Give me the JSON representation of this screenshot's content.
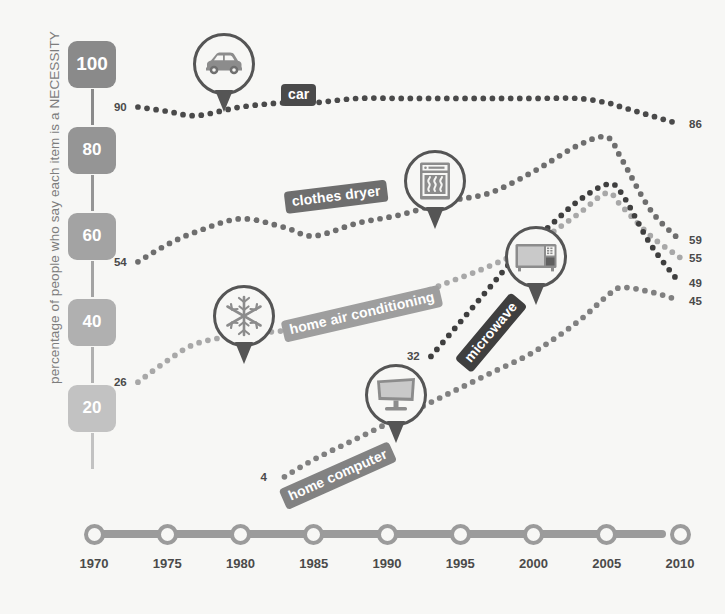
{
  "chart": {
    "type": "line",
    "ylabel": "percentage of people who say each item is a NECESSITY",
    "xlabel": "",
    "title": "",
    "ylim": [
      0,
      105
    ],
    "xlim": [
      1970,
      2010
    ],
    "y_ticks": [
      {
        "label": "100",
        "value": 100,
        "color": "#8a8a8a"
      },
      {
        "label": "80",
        "value": 80,
        "color": "#959595"
      },
      {
        "label": "60",
        "value": 60,
        "color": "#a3a3a3"
      },
      {
        "label": "40",
        "value": 40,
        "color": "#b0b0b0"
      },
      {
        "label": "20",
        "value": 20,
        "color": "#c2c2c2"
      }
    ],
    "x_ticks": [
      "1970",
      "1975",
      "1980",
      "1985",
      "1990",
      "1995",
      "2000",
      "2005",
      "2010"
    ],
    "axis_color": "#9b9b9b",
    "background": "#f7f7f5",
    "grid": false,
    "legend_position": "inline-callouts",
    "series": [
      {
        "name": "car",
        "label": "car",
        "icon": "car-icon",
        "color": "#4a4a4a",
        "label_bg": "#4a4a4a",
        "start_label": "90",
        "end_label": "86",
        "x": [
          1973,
          1975,
          1977,
          1980,
          1983,
          1985,
          1988,
          1991,
          1994,
          1997,
          2000,
          2003,
          2005,
          2006,
          2008,
          2010
        ],
        "values": [
          90,
          89,
          88,
          90,
          91,
          91,
          92,
          92,
          92,
          92,
          92,
          92,
          91,
          90,
          88,
          86
        ]
      },
      {
        "name": "clothes-dryer",
        "label": "clothes dryer",
        "icon": "clothes-dryer-icon",
        "color": "#6e6e6e",
        "label_bg": "#6e6e6e",
        "start_label": "54",
        "end_label": "59",
        "x": [
          1973,
          1975,
          1977,
          1980,
          1983,
          1985,
          1988,
          1991,
          1994,
          1997,
          2000,
          2003,
          2005,
          2006,
          2008,
          2010
        ],
        "values": [
          54,
          58,
          61,
          64,
          62,
          60,
          63,
          65,
          68,
          70,
          75,
          81,
          83,
          78,
          66,
          59
        ]
      },
      {
        "name": "home-air-conditioning",
        "label": "home air conditioning",
        "icon": "snowflake-icon",
        "color": "#a8a8a8",
        "label_bg": "#9e9e9e",
        "start_label": "26",
        "end_label": "55",
        "x": [
          1973,
          1975,
          1977,
          1980,
          1983,
          1985,
          1988,
          1991,
          1994,
          1997,
          2000,
          2003,
          2005,
          2006,
          2008,
          2010
        ],
        "values": [
          26,
          31,
          35,
          37,
          38,
          39,
          42,
          45,
          49,
          53,
          58,
          65,
          70,
          67,
          60,
          55
        ]
      },
      {
        "name": "microwave",
        "label": "microwave",
        "icon": "microwave-icon",
        "color": "#3f3f3f",
        "label_bg": "#3f3f3f",
        "start_label": "32",
        "end_label": "49",
        "x": [
          1993,
          1995,
          1997,
          1999,
          2001,
          2003,
          2005,
          2006,
          2008,
          2010
        ],
        "values": [
          32,
          40,
          48,
          56,
          62,
          68,
          72,
          70,
          58,
          49
        ]
      },
      {
        "name": "home-computer",
        "label": "home computer",
        "icon": "home-computer-icon",
        "color": "#808080",
        "label_bg": "#828282",
        "start_label": "4",
        "end_label": "45",
        "x": [
          1983,
          1985,
          1988,
          1991,
          1994,
          1997,
          2000,
          2003,
          2005,
          2006,
          2008,
          2010
        ],
        "values": [
          4,
          8,
          13,
          18,
          23,
          28,
          33,
          40,
          46,
          48,
          47,
          45
        ]
      }
    ]
  },
  "callouts": [
    {
      "name": "car",
      "label": "car"
    },
    {
      "name": "clothes dryer",
      "label": "clothes dryer"
    },
    {
      "name": "home air conditioning",
      "label": "home air conditioning"
    },
    {
      "name": "microwave",
      "label": "microwave"
    },
    {
      "name": "home computer",
      "label": "home computer"
    }
  ]
}
